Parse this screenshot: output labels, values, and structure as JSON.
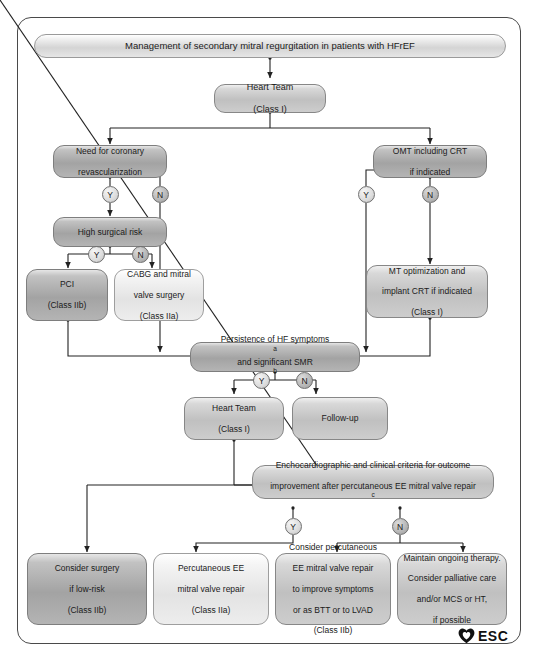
{
  "figure": {
    "title": "Management of secondary mitral regurgitation in patients with HFrEF",
    "logo_text": "ESC",
    "logo_icon": "heart-icon"
  },
  "nodes": {
    "heart_team_top": {
      "line1": "Heart Team",
      "line2": "(Class I)"
    },
    "need_revasc": {
      "line1": "Need for coronary",
      "line2": "revascularization"
    },
    "omt_crt": {
      "line1": "OMT including CRT",
      "line2": "if indicated"
    },
    "high_risk": {
      "line1": "High surgical risk"
    },
    "pci": {
      "line1": "PCI",
      "line2": "(Class IIb)"
    },
    "cabg": {
      "line1": "CABG and mitral",
      "line2": "valve surgery",
      "line3": "(Class IIa)"
    },
    "mt_opt": {
      "line1": "MT optimization and",
      "line2": "implant CRT if indicated",
      "line3": "(Class I)"
    },
    "persistence": {
      "line1": "Persistence of HF symptoms",
      "sup1": "a",
      "line2": "and significant SMR",
      "sup2": "b"
    },
    "heart_team_2": {
      "line1": "Heart Team",
      "line2": "(Class I)"
    },
    "follow_up": {
      "line1": "Follow-up"
    },
    "echo_criteria": {
      "line1": "Enchocardiographic and clinical criteria for outcome",
      "line2": "improvement after percutaneous EE mitral valve repair",
      "sup2": "c"
    },
    "consider_surgery": {
      "line1": "Consider surgery",
      "line2": "if low-risk",
      "line3": "(Class IIb)"
    },
    "perc_repair": {
      "line1": "Percutaneous EE",
      "line2": "mitral valve repair",
      "line3": "(Class IIa)"
    },
    "consider_perc": {
      "line1": "Consider percutaneous",
      "line2": "EE mitral valve repair",
      "line3": "to improve symptoms",
      "line4": "or as BTT or to LVAD",
      "line5": "(Class IIb)"
    },
    "maintain": {
      "line1": "Maintain ongoing therapy.",
      "line2": "Consider palliative care",
      "line3": "and/or MCS or HT,",
      "line4": "if possible"
    }
  },
  "decisions": {
    "revasc_y": "Y",
    "revasc_n": "N",
    "omt_y": "Y",
    "omt_n": "N",
    "risk_y": "Y",
    "risk_n": "N",
    "persist_y": "Y",
    "persist_n": "N",
    "echo_y": "Y",
    "echo_n": "N"
  }
}
